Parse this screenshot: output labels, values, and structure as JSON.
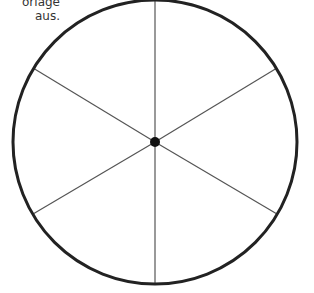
{
  "caption": {
    "line1": "orlage",
    "line2": "aus."
  },
  "diagram": {
    "center": [
      155,
      142
    ],
    "radius": 143,
    "spokes": 6,
    "circle_color": "#222222",
    "spoke_color": "#555555"
  }
}
